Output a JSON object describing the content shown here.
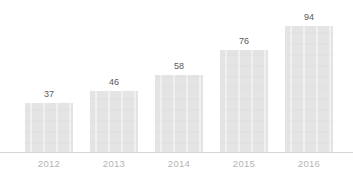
{
  "chart_data": {
    "type": "bar",
    "title": "",
    "subtitle": "",
    "xlabel": "",
    "ylabel": "",
    "categories": [
      "2012",
      "2013",
      "2014",
      "2015",
      "2016"
    ],
    "values": [
      37,
      46,
      58,
      76,
      94
    ],
    "value_labels": [
      "37",
      "46",
      "58",
      "76",
      "94"
    ],
    "series": [
      {
        "name": "",
        "values": [
          37,
          46,
          58,
          76,
          94
        ]
      }
    ],
    "ylim": [
      0,
      94
    ],
    "grid": false,
    "legend": false,
    "legend_position": "none",
    "axis_line": "bottom",
    "bar_color": "#e4e4e4",
    "value_label_color": "#595959",
    "tick_label_color": "#b4b4b4",
    "axis_color": "#d6d6d6",
    "background_color": "#ffffff"
  },
  "title_remnant": {
    "text": "··· ··· ··· ··· ··· ··· ··· ···"
  }
}
